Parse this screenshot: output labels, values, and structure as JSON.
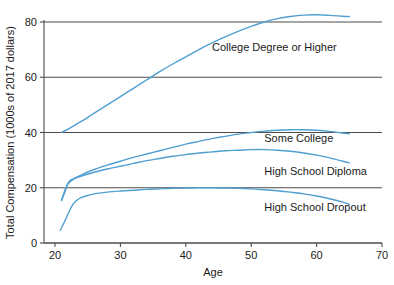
{
  "chart_data": {
    "type": "line",
    "title": "",
    "xlabel": "Age",
    "ylabel": "Total Compensation (1000s of 2017 dollars)",
    "xlim": [
      18,
      71
    ],
    "ylim": [
      0,
      86
    ],
    "x_ticks": [
      20,
      30,
      40,
      50,
      60,
      70
    ],
    "y_ticks": [
      0,
      20,
      40,
      60,
      80
    ],
    "grid": "horizontal",
    "legend_position": "inline-annotations",
    "line_color": "#4f9fd1",
    "axis_color": "#4d4d4d",
    "series": [
      {
        "name": "College Degree or Higher",
        "label": "College Degree or Higher",
        "label_x": 44,
        "label_y": 71,
        "x": [
          21,
          22,
          24,
          26,
          28,
          30,
          32,
          34,
          36,
          38,
          40,
          42,
          44,
          46,
          48,
          50,
          52,
          54,
          56,
          58,
          60,
          62,
          64,
          65
        ],
        "y": [
          40.0,
          41.2,
          44.0,
          47.0,
          50.0,
          53.0,
          56.0,
          59.0,
          62.0,
          64.8,
          67.4,
          70.0,
          72.4,
          74.6,
          76.6,
          78.4,
          80.0,
          81.2,
          82.0,
          82.5,
          82.6,
          82.4,
          82.1,
          82.0
        ]
      },
      {
        "name": "Some College",
        "label": "Some College",
        "label_x": 52,
        "label_y": 38,
        "x": [
          21,
          21.6,
          22,
          23,
          24,
          26,
          28,
          30,
          32,
          34,
          36,
          38,
          40,
          42,
          44,
          46,
          48,
          50,
          52,
          54,
          56,
          58,
          60,
          62,
          64,
          65
        ],
        "y": [
          15.4,
          19.0,
          21.4,
          23.4,
          24.6,
          26.6,
          28.2,
          29.6,
          31.0,
          32.2,
          33.4,
          34.6,
          35.8,
          36.8,
          37.8,
          38.6,
          39.4,
          40.0,
          40.5,
          40.8,
          41.0,
          41.0,
          40.8,
          40.4,
          39.8,
          39.5
        ]
      },
      {
        "name": "High School Diploma",
        "label": "High School Diploma",
        "label_x": 52,
        "label_y": 26,
        "x": [
          21,
          21.6,
          22.2,
          23,
          24,
          26,
          28,
          30,
          32,
          34,
          36,
          38,
          40,
          42,
          44,
          46,
          48,
          50,
          52,
          54,
          56,
          58,
          60,
          62,
          64,
          65
        ],
        "y": [
          15.4,
          19.6,
          22.4,
          23.4,
          24.2,
          25.6,
          26.8,
          27.8,
          28.8,
          29.8,
          30.6,
          31.4,
          32.0,
          32.6,
          33.0,
          33.4,
          33.6,
          33.8,
          33.8,
          33.6,
          33.2,
          32.6,
          31.8,
          30.8,
          29.6,
          29.0
        ]
      },
      {
        "name": "High School Dropout",
        "label": "High School Dropout",
        "label_x": 52,
        "label_y": 13,
        "x": [
          20.8,
          21.4,
          22,
          22.6,
          23.2,
          24,
          25,
          26,
          28,
          30,
          32,
          34,
          36,
          38,
          40,
          42,
          44,
          46,
          48,
          50,
          52,
          54,
          56,
          58,
          60,
          62,
          64,
          65
        ],
        "y": [
          4.6,
          7.4,
          10.6,
          13.4,
          15.2,
          16.4,
          17.2,
          17.8,
          18.4,
          18.8,
          19.1,
          19.4,
          19.6,
          19.8,
          19.9,
          20.0,
          20.0,
          19.9,
          19.8,
          19.6,
          19.3,
          18.9,
          18.4,
          17.8,
          17.0,
          16.0,
          14.8,
          14.0
        ]
      }
    ]
  }
}
